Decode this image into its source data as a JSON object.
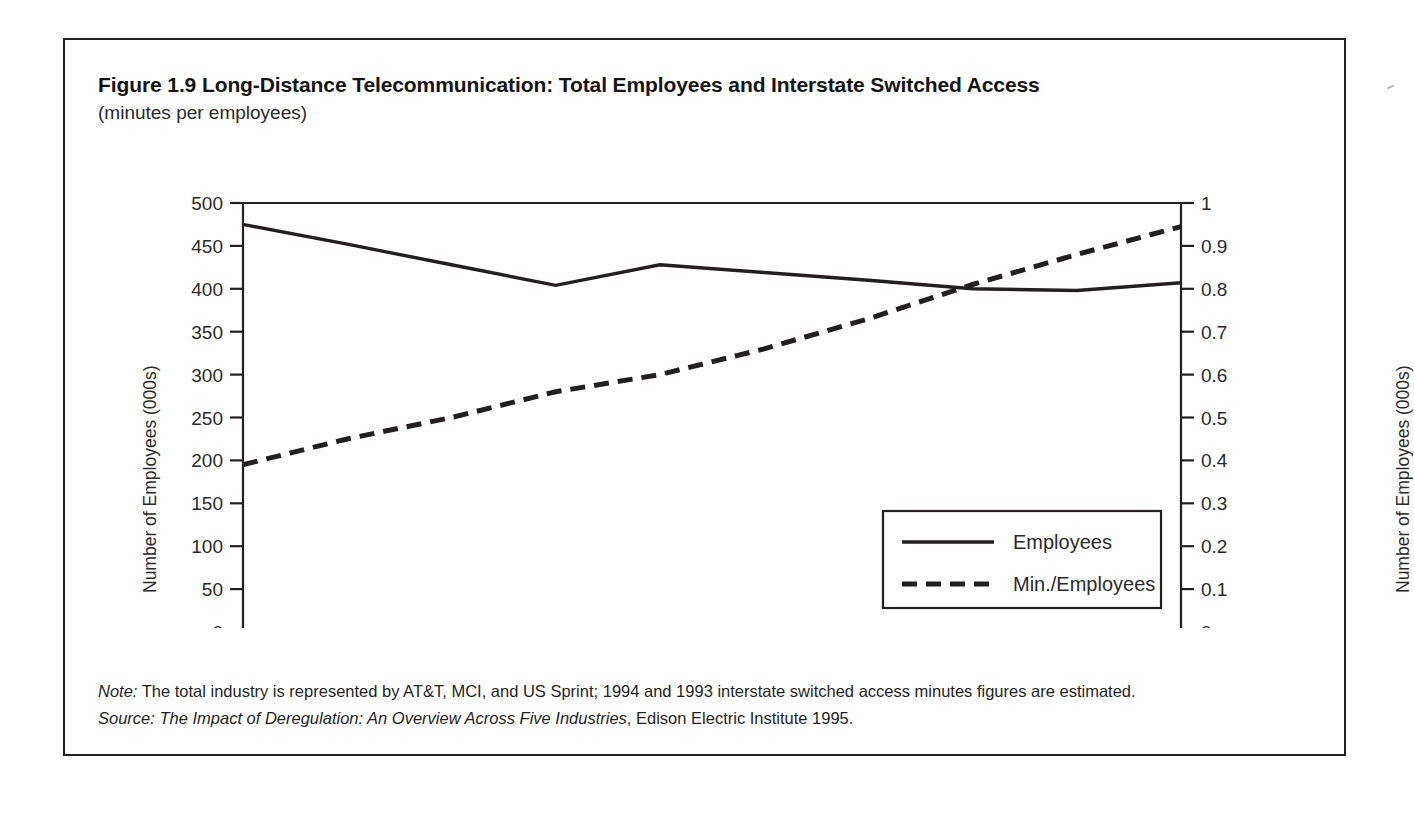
{
  "figure": {
    "title": "Figure 1.9 Long-Distance Telecommunication: Total Employees and Interstate Switched Access",
    "subtitle": "(minutes per employees)",
    "note": "Note: The total industry is represented by AT&T, MCI, and US Sprint; 1994 and 1993 interstate switched access minutes figures are estimated.",
    "note_label": "Note:",
    "note_body": " The total industry is represented by AT&T, MCI, and US Sprint; 1994 and 1993 interstate switched access minutes figures are estimated.",
    "source_label": "Source:",
    "source_title": " The Impact of Deregulation: An Overview Across Five Industries",
    "source_rest": ", Edison Electric Institute 1995."
  },
  "colors": {
    "line": "#231f20",
    "axis": "#231f20",
    "border": "#231f20",
    "text": "#1f1f1f",
    "background": "#ffffff"
  },
  "chart_data": {
    "type": "line",
    "title": "Figure 1.9 Long-Distance Telecommunication: Total Employees and Interstate Switched Access",
    "subtitle": "(minutes per employees)",
    "xlabel": "",
    "ylabel": "Number of Employees (000s)",
    "y2label": "Number of Employees (000s)",
    "categories": [
      "1984",
      "1985",
      "1986",
      "1987",
      "1988",
      "1989",
      "1990",
      "1991",
      "1992",
      "1993"
    ],
    "x": [
      1984,
      1985,
      1986,
      1987,
      1988,
      1989,
      1990,
      1991,
      1992,
      1993
    ],
    "ylim": [
      0,
      500
    ],
    "yticks": [
      0,
      50,
      100,
      150,
      200,
      250,
      300,
      350,
      400,
      450,
      500
    ],
    "ytick_labels": [
      "0",
      "50",
      "100",
      "150",
      "200",
      "250",
      "300",
      "350",
      "400",
      "450",
      "500"
    ],
    "y2lim": [
      0,
      1
    ],
    "y2ticks": [
      0,
      0.1,
      0.2,
      0.3,
      0.4,
      0.5,
      0.6,
      0.7,
      0.8,
      0.9,
      1
    ],
    "y2tick_labels": [
      "0",
      "0.1",
      "0.2",
      "0.3",
      "0.4",
      "0.5",
      "0.6",
      "0.7",
      "0.8",
      "0.9",
      "1"
    ],
    "grid": false,
    "legend_position": "lower right",
    "series": [
      {
        "name": "Employees",
        "axis": "left",
        "style": "solid",
        "values": [
          475,
          452,
          428,
          404,
          428,
          419,
          410,
          400,
          398,
          407
        ]
      },
      {
        "name": "Min./Employees",
        "axis": "right",
        "style": "dashed",
        "values": [
          0.39,
          0.45,
          0.5,
          0.56,
          0.6,
          0.66,
          0.73,
          0.81,
          0.88,
          0.945
        ]
      }
    ],
    "legend": [
      {
        "label": "Employees",
        "style": "solid"
      },
      {
        "label": "Min./Employees",
        "style": "dashed"
      }
    ]
  }
}
